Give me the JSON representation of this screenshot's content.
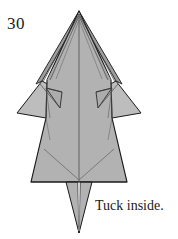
{
  "page": {
    "background_color": "#ffffff",
    "width": 178,
    "height": 239
  },
  "step": {
    "number": "30"
  },
  "caption": {
    "text": "Tuck inside."
  },
  "diagram": {
    "name": "origami-folded-model",
    "fill_color": "#b2b2b2",
    "shadow_color": "#9a9a9a",
    "highlight_color": "#c4c4c4",
    "stroke_color": "#1a1a1a",
    "crease_color": "#5a5a5a"
  }
}
